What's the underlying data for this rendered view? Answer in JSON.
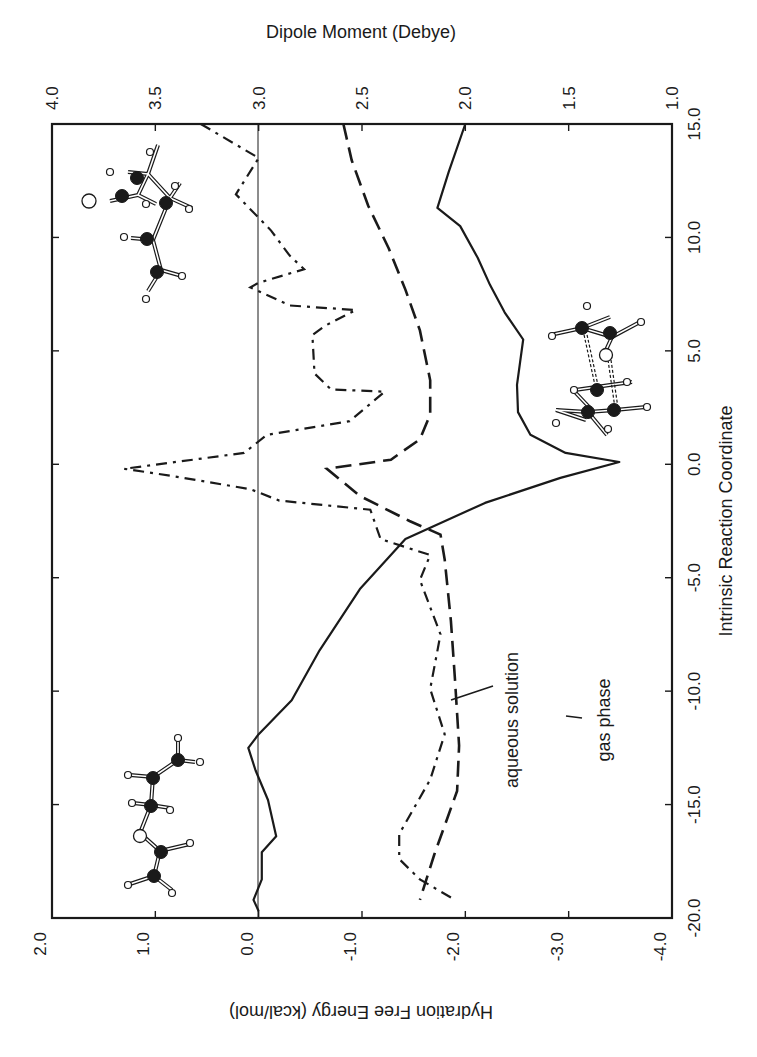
{
  "chart_data": {
    "type": "line",
    "orientation": "rotated-90 (IRC axis runs vertically, value axes run horizontally)",
    "title": "",
    "axes": {
      "irc": {
        "label": "Intrinsic Reaction Coordinate",
        "position": "right",
        "range": [
          -20.0,
          15.0
        ],
        "ticks": [
          "-20.0",
          "-15.0",
          "-10.0",
          "-5.0",
          "0.0",
          "5.0",
          "10.0",
          "15.0"
        ]
      },
      "hydration": {
        "label": "Hydration Free Energy (kcal/mol)",
        "position": "bottom",
        "range": [
          2.0,
          -4.0
        ],
        "ticks": [
          "2.0",
          "1.0",
          "0.0",
          "-1.0",
          "-2.0",
          "-3.0",
          "-4.0"
        ]
      },
      "dipole": {
        "label": "Dipole Moment (Debye)",
        "position": "top",
        "range": [
          4.0,
          1.0
        ],
        "ticks": [
          "4.0",
          "3.5",
          "3.0",
          "2.5",
          "2.0",
          "1.5",
          "1.0"
        ]
      }
    },
    "reference_line": {
      "axis": "hydration",
      "value": 0.0,
      "note": "thin vertical line at 0.0 kcal/mol (= 3.0 Debye)"
    },
    "grid": false,
    "series": [
      {
        "name": "Hydration Free Energy",
        "axis": "hydration",
        "style": "solid",
        "irc": [
          15.0,
          12.9,
          11.3,
          10.5,
          9.1,
          7.9,
          6.7,
          5.5,
          4.5,
          3.5,
          2.3,
          1.3,
          0.5,
          0.1,
          -0.6,
          -1.7,
          -3.3,
          -5.5,
          -8.2,
          -10.4,
          -11.9,
          -12.5,
          -13.5,
          -14.8,
          -16.4,
          -17.1,
          -18.3,
          -19.2,
          -19.7
        ],
        "values": [
          -2.0,
          -1.84,
          -1.73,
          -1.95,
          -2.12,
          -2.24,
          -2.38,
          -2.56,
          -2.53,
          -2.5,
          -2.51,
          -2.63,
          -2.97,
          -3.49,
          -2.92,
          -2.19,
          -1.42,
          -0.98,
          -0.59,
          -0.32,
          0.0,
          0.1,
          0.03,
          -0.09,
          -0.17,
          -0.03,
          -0.03,
          0.05,
          0.0
        ]
      },
      {
        "name": "gas phase",
        "axis": "dipole",
        "style": "long-dash",
        "irc": [
          15.0,
          13.4,
          11.4,
          9.5,
          7.7,
          5.9,
          3.7,
          2.2,
          1.1,
          0.2,
          -0.2,
          -1.4,
          -2.5,
          -3.1,
          -4.2,
          -6.9,
          -9.5,
          -12.4,
          -14.4,
          -17.2,
          -19.2
        ],
        "values": [
          2.59,
          2.55,
          2.47,
          2.37,
          2.29,
          2.22,
          2.17,
          2.17,
          2.22,
          2.36,
          2.67,
          2.51,
          2.27,
          2.12,
          2.1,
          2.07,
          2.05,
          2.03,
          2.04,
          2.15,
          2.22
        ]
      },
      {
        "name": "aqueous solution",
        "axis": "dipole",
        "style": "dash-dot",
        "irc": [
          15.0,
          13.5,
          11.9,
          10.3,
          9.2,
          8.6,
          8.0,
          7.8,
          7.0,
          6.8,
          6.1,
          5.7,
          4.0,
          3.3,
          3.2,
          1.9,
          1.3,
          0.5,
          -0.2,
          -0.5,
          -1.1,
          -1.6,
          -2.0,
          -3.3,
          -4.0,
          -5.1,
          -7.5,
          -9.9,
          -11.9,
          -13.9,
          -16.3,
          -17.4,
          -18.3,
          -19.2
        ],
        "values": [
          3.28,
          3.0,
          3.11,
          2.94,
          2.85,
          2.78,
          3.0,
          3.04,
          2.85,
          2.53,
          2.68,
          2.74,
          2.73,
          2.65,
          2.39,
          2.56,
          2.96,
          3.07,
          3.65,
          3.43,
          3.04,
          2.9,
          2.46,
          2.41,
          2.17,
          2.22,
          2.12,
          2.17,
          2.1,
          2.17,
          2.32,
          2.32,
          2.22,
          2.05
        ]
      }
    ],
    "annotations": [
      {
        "text": "aqueous solution",
        "target_series": "aqueous solution",
        "leader_line": true
      },
      {
        "text": "gas phase",
        "target_series": "gas phase",
        "leader_line": true
      },
      {
        "type": "molecule-image",
        "description": "product conformer (ball-and-stick)",
        "region": "top-left"
      },
      {
        "type": "molecule-image",
        "description": "transition state (ball-and-stick, dashed forming bonds)",
        "region": "right, near IRC 2-7"
      },
      {
        "type": "molecule-image",
        "description": "reactant conformer (ball-and-stick)",
        "region": "bottom-left"
      }
    ]
  },
  "labels": {
    "top_axis_title": "Dipole Moment (Debye)",
    "bottom_axis_title": "Hydration Free Energy (kcal/mol)",
    "right_axis_title": "Intrinsic Reaction Coordinate",
    "aqueous_label": "aqueous solution",
    "gas_label": "gas phase"
  },
  "colors": {
    "ink": "#1a1a1a",
    "background": "#ffffff",
    "atom_dark": "#1a1a1a",
    "atom_light": "#ffffff"
  }
}
